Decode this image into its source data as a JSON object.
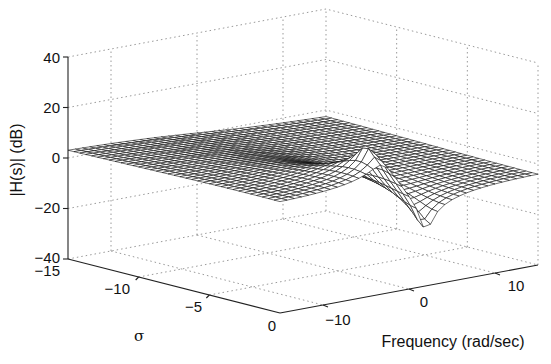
{
  "chart_data": {
    "type": "surface",
    "title": "",
    "zlabel": "|H(s)| (dB)",
    "xlabel": "σ",
    "ylabel": "Frequency (rad/sec)",
    "zlim": [
      -40,
      40
    ],
    "z_ticks": [
      "40",
      "20",
      "0",
      "−20",
      "−40"
    ],
    "sigma_lim": [
      -15,
      0
    ],
    "sigma_ticks": [
      "−15",
      "−10",
      "−5",
      "0"
    ],
    "freq_lim": [
      -15,
      15
    ],
    "freq_ticks": [
      "−10",
      "0",
      "10"
    ],
    "grid": true,
    "features": [
      {
        "kind": "pole-peak",
        "sigma": -1,
        "freq": -3,
        "z_db": 33
      },
      {
        "kind": "zero-dip",
        "sigma": 0,
        "freq": 2,
        "z_db": -37
      }
    ]
  },
  "labels": {
    "z_axis": "|H(s)| (dB)",
    "sigma_axis": "σ",
    "freq_axis": "Frequency (rad/sec)"
  }
}
